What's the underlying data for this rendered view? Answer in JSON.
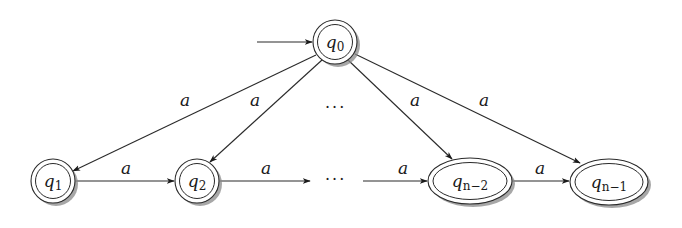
{
  "diagram": {
    "type": "nfa",
    "start_state": "q0",
    "states": [
      {
        "id": "q0",
        "base": "q",
        "sub": "0",
        "accepting": true,
        "cx": 335,
        "cy": 42,
        "rx": 22,
        "ry": 22
      },
      {
        "id": "q1",
        "base": "q",
        "sub": "1",
        "accepting": true,
        "cx": 53,
        "cy": 181,
        "rx": 22,
        "ry": 22
      },
      {
        "id": "q2",
        "base": "q",
        "sub": "2",
        "accepting": true,
        "cx": 197,
        "cy": 181,
        "rx": 22,
        "ry": 22
      },
      {
        "id": "qn-2",
        "base": "q",
        "sub": "n−2",
        "accepting": true,
        "cx": 470,
        "cy": 181,
        "rx": 42,
        "ry": 23
      },
      {
        "id": "qn-1",
        "base": "q",
        "sub": "n−1",
        "accepting": true,
        "cx": 609,
        "cy": 182,
        "rx": 39,
        "ry": 23
      }
    ],
    "transitions": [
      {
        "from": "q0",
        "to": "q1",
        "label": "a"
      },
      {
        "from": "q0",
        "to": "q2",
        "label": "a"
      },
      {
        "from": "q0",
        "to": "qn-2",
        "label": "a"
      },
      {
        "from": "q0",
        "to": "qn-1",
        "label": "a"
      },
      {
        "from": "q1",
        "to": "q2",
        "label": "a"
      },
      {
        "from": "q2",
        "to": "…",
        "label": "a"
      },
      {
        "from": "…",
        "to": "qn-2",
        "label": "a"
      },
      {
        "from": "qn-2",
        "to": "qn-1",
        "label": "a"
      }
    ],
    "ellipsis_top": "···",
    "ellipsis_bottom": "···",
    "colors": {
      "stroke": "#2a2a2a",
      "shadow": "#8a8a8a",
      "background": "#ffffff"
    }
  },
  "labels": {
    "q0_base": "q",
    "q0_sub": "0",
    "q1_base": "q",
    "q1_sub": "1",
    "q2_base": "q",
    "q2_sub": "2",
    "qn2_base": "q",
    "qn2_sub": "n−2",
    "qn1_base": "q",
    "qn1_sub": "n−1",
    "edge_q0_q1": "a",
    "edge_q0_q2": "a",
    "edge_q0_qn2": "a",
    "edge_q0_qn1": "a",
    "edge_q1_q2": "a",
    "edge_q2_dots": "a",
    "edge_dots_qn2": "a",
    "edge_qn2_qn1": "a",
    "dots_top": "···",
    "dots_bottom": "···"
  }
}
